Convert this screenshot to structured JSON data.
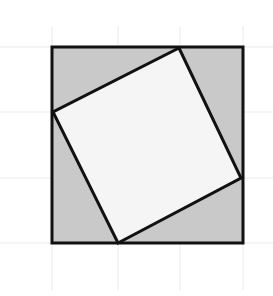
{
  "figure": {
    "canvas": {
      "width": 273,
      "height": 296,
      "background": "#ffffff"
    },
    "colors": {
      "grid_line": "#e9e9e9",
      "outer_square_fill": "#c9c9c9",
      "inner_square_fill": "#f5f5f5",
      "stroke": "#111111",
      "background": "#ffffff"
    },
    "grid": {
      "visible": true,
      "line_color": "#e9e9e9",
      "line_width": 1,
      "vertical_x": [
        52,
        118,
        180,
        243
      ],
      "horizontal_y": [
        47,
        112,
        178,
        243
      ],
      "spacing": 65
    },
    "outer_square": {
      "label": "outer square",
      "fill": "#c9c9c9",
      "stroke": "#111111",
      "stroke_width": 3,
      "side_length": 191,
      "points": "52,47 243,47 243,243 52,243",
      "corners": [
        {
          "name": "top-left",
          "x": 52,
          "y": 47
        },
        {
          "name": "top-right",
          "x": 243,
          "y": 47
        },
        {
          "name": "bottom-right",
          "x": 243,
          "y": 243
        },
        {
          "name": "bottom-left",
          "x": 52,
          "y": 243
        }
      ]
    },
    "inner_square": {
      "label": "inscribed tilted square",
      "fill": "#f5f5f5",
      "stroke": "#111111",
      "stroke_width": 3,
      "points": "179,48 241,178 118,243 53,112",
      "vertices": [
        {
          "name": "top-vertex",
          "x": 179,
          "y": 48,
          "on_edge": "top"
        },
        {
          "name": "right-vertex",
          "x": 241,
          "y": 178,
          "on_edge": "right"
        },
        {
          "name": "bottom-vertex",
          "x": 118,
          "y": 243,
          "on_edge": "bottom"
        },
        {
          "name": "left-vertex",
          "x": 53,
          "y": 112,
          "on_edge": "left"
        }
      ]
    }
  }
}
